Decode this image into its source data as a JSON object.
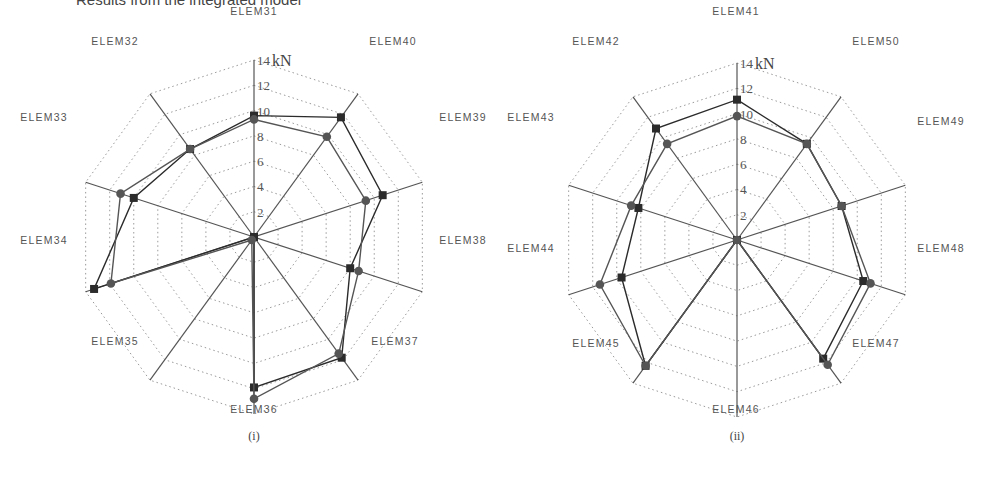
{
  "header": {
    "text": "Results from the integrated model"
  },
  "chart_data": [
    {
      "type": "radar",
      "caption": "(i)",
      "unit": "kN",
      "rmax": 14,
      "ticks": [
        2,
        4,
        6,
        8,
        10,
        12,
        14
      ],
      "tick_labels": [
        "2",
        "4",
        "6",
        "8",
        "10",
        "12",
        "14"
      ],
      "grid": "dotted",
      "legend": null,
      "categories": [
        "ELEM31",
        "ELEM40",
        "ELEM39",
        "ELEM38",
        "ELEM37",
        "ELEM36",
        "ELEM35",
        "ELEM34",
        "ELEM33",
        "ELEM32"
      ],
      "series": [
        {
          "name": "square-marker series",
          "marker": "square",
          "values": [
            9.6,
            11.7,
            10.7,
            8.0,
            11.8,
            11.9,
            0.0,
            13.3,
            10.0,
            8.6
          ]
        },
        {
          "name": "circle-marker series",
          "marker": "circle",
          "values": [
            9.3,
            9.8,
            9.3,
            8.7,
            11.4,
            12.8,
            0.3,
            11.9,
            11.1,
            8.6
          ]
        }
      ]
    },
    {
      "type": "radar",
      "caption": "(ii)",
      "unit": "kN",
      "rmax": 14,
      "ticks": [
        2,
        4,
        6,
        8,
        10,
        12,
        14
      ],
      "tick_labels": [
        "2",
        "4",
        "6",
        "8",
        "10",
        "12",
        "14"
      ],
      "grid": "dotted",
      "legend": null,
      "categories": [
        "ELEM41",
        "ELEM50",
        "ELEM49",
        "ELEM48",
        "ELEM47",
        "ELEM46",
        "ELEM45",
        "ELEM44",
        "ELEM43",
        "ELEM42"
      ],
      "series": [
        {
          "name": "square-marker series",
          "marker": "square",
          "values": [
            11.1,
            9.4,
            8.7,
            10.5,
            11.6,
            0.0,
            12.3,
            9.6,
            8.2,
            10.9
          ]
        },
        {
          "name": "circle-marker series",
          "marker": "circle",
          "values": [
            9.8,
            9.4,
            8.7,
            11.1,
            12.2,
            0.0,
            12.3,
            11.4,
            8.8,
            9.4
          ]
        }
      ]
    }
  ],
  "layout": {
    "charts": [
      {
        "cx": 254,
        "cy": 237,
        "r": 177,
        "caption_y": 440,
        "label_pos": [
          [
            254,
            15
          ],
          [
            393,
            45
          ],
          [
            463,
            121
          ],
          [
            463,
            244
          ],
          [
            395,
            345
          ],
          [
            254,
            413
          ],
          [
            115,
            345
          ],
          [
            44,
            244
          ],
          [
            44,
            121
          ],
          [
            115,
            45
          ]
        ]
      },
      {
        "cx": 737,
        "cy": 240,
        "r": 177,
        "caption_y": 440,
        "label_pos": [
          [
            736,
            15
          ],
          [
            876,
            45
          ],
          [
            941,
            125
          ],
          [
            941,
            252
          ],
          [
            876,
            347
          ],
          [
            736,
            413
          ],
          [
            596,
            347
          ],
          [
            531,
            252
          ],
          [
            531,
            121
          ],
          [
            596,
            45
          ]
        ]
      }
    ],
    "colors": {
      "axis": "#555555",
      "grid": "#9a9a9a",
      "series_square": "#2b2b2b",
      "series_circle": "#555555",
      "text": "#555555"
    }
  }
}
